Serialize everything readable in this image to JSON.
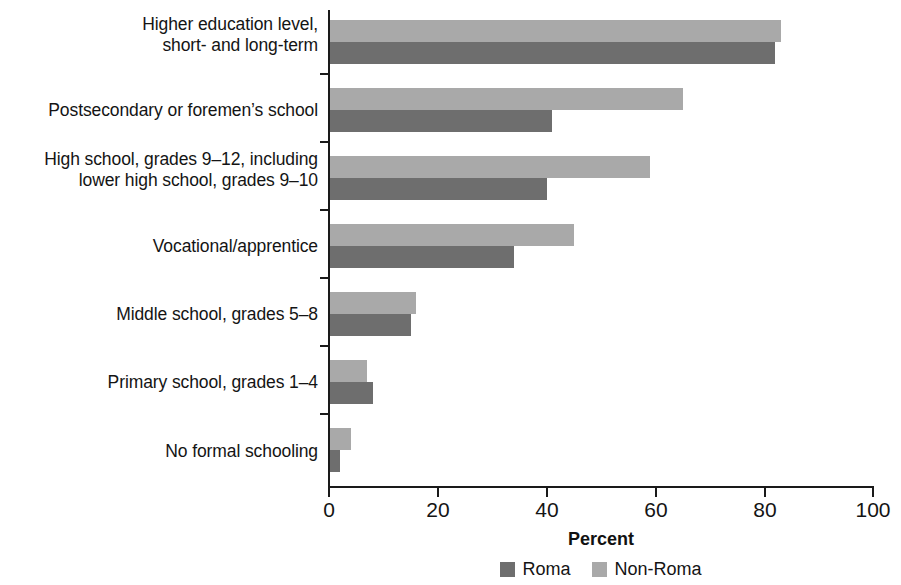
{
  "chart_data": {
    "type": "bar",
    "orientation": "horizontal",
    "title": "",
    "xlabel": "Percent",
    "ylabel": "",
    "xlim": [
      0,
      100
    ],
    "grid": false,
    "legend_position": "bottom",
    "xticks": [
      "0",
      "20",
      "40",
      "60",
      "80",
      "100"
    ],
    "categories": [
      "Higher education level,\nshort- and long-term",
      "Postsecondary or foremen’s school",
      "High school, grades 9–12, including\nlower high school, grades 9–10",
      "Vocational/apprentice",
      "Middle school, grades 5–8",
      "Primary school, grades 1–4",
      "No formal schooling"
    ],
    "series": [
      {
        "name": "Roma",
        "color": "#6e6e6e",
        "values": [
          82,
          41,
          40,
          34,
          15,
          8,
          2
        ]
      },
      {
        "name": "Non-Roma",
        "color": "#a9a9a9",
        "values": [
          83,
          65,
          59,
          45,
          16,
          7,
          4
        ]
      }
    ]
  },
  "legend": {
    "items": [
      {
        "label": "Roma"
      },
      {
        "label": "Non-Roma"
      }
    ]
  }
}
